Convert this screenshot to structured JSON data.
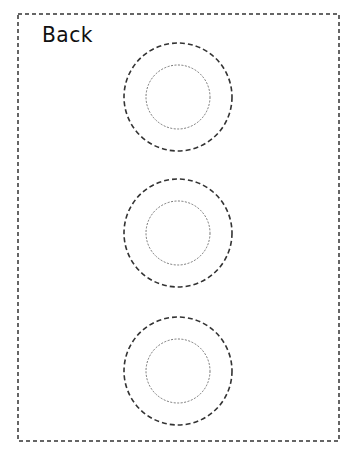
{
  "page": {
    "title": "Back",
    "border_color": "#333333",
    "border_style": "dashed"
  },
  "circles": [
    {
      "cx": 178,
      "cy": 97,
      "outer_r": 54,
      "inner_r": 32
    },
    {
      "cx": 178,
      "cy": 233,
      "outer_r": 54,
      "inner_r": 32
    },
    {
      "cx": 178,
      "cy": 371,
      "outer_r": 54,
      "inner_r": 32
    }
  ]
}
